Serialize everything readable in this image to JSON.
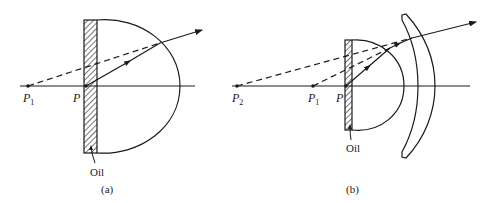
{
  "figure": {
    "panels": [
      {
        "id": "a",
        "caption": "(a)",
        "oil_label": "Oil",
        "points": [
          {
            "name": "P",
            "sub": "1"
          },
          {
            "name": "P",
            "sub": ""
          }
        ]
      },
      {
        "id": "b",
        "caption": "(b)",
        "oil_label": "Oil",
        "points": [
          {
            "name": "P",
            "sub": "2"
          },
          {
            "name": "P",
            "sub": "1"
          },
          {
            "name": "P",
            "sub": ""
          }
        ]
      }
    ],
    "colors": {
      "stroke": "#1a1a1a",
      "background": "#ffffff"
    }
  }
}
